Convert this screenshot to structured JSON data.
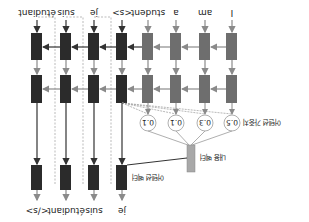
{
  "diagram": {
    "type": "seq2seq-attention",
    "orientation": "rotated-180",
    "encoder_inputs": [
      "I",
      "am",
      "a",
      "student"
    ],
    "decoder_inputs": [
      "<s>",
      "je",
      "suis",
      "étudiant"
    ],
    "decoder_outputs": [
      "je",
      "suis",
      "étudiant",
      "</s>"
    ],
    "attention_weights": [
      "0.5",
      "0.3",
      "0.1",
      "0.1"
    ],
    "labels": {
      "attention_weights": "어텐션 가중치",
      "context_vector": "내용 벡터",
      "attention_vector": "어텐션 벡터"
    },
    "colors": {
      "encoder_box": "#6e6e6e",
      "decoder_box": "#2b2b2b",
      "context_box": "#a8a8a8",
      "arrow": "#8a8a8a",
      "circle_stroke": "#9a9a9a"
    }
  }
}
